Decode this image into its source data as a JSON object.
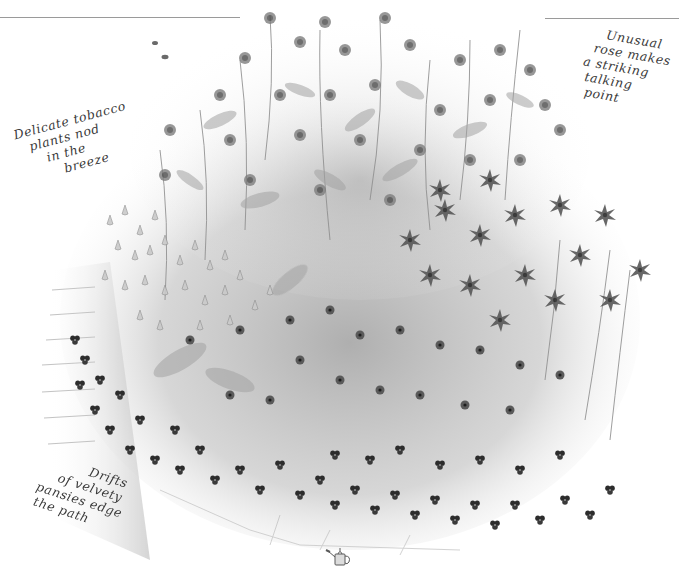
{
  "page": {
    "background": "#ffffff",
    "ink_color": "#3a3a3a",
    "rule_color": "#9a9a9a"
  },
  "illustration": {
    "subject": "cottage-garden-flower-bed",
    "style": "grayscale-watercolor",
    "elements": [
      "tall-flowering-shrubs",
      "nicotiana-tobacco-plants",
      "unusual-rose",
      "velvety-pansies",
      "brick-path",
      "bees",
      "watering-can-ornament"
    ]
  },
  "captions": {
    "rose": {
      "lines": [
        "Unusual",
        "rose makes",
        "a striking",
        "talking",
        "point"
      ]
    },
    "tobacco": {
      "lines": [
        "Delicate tobacco",
        "plants nod",
        "in the",
        "breeze"
      ]
    },
    "pansies": {
      "lines": [
        "Drifts",
        "of velvety",
        "pansies edge",
        "the path"
      ]
    }
  },
  "icons": {
    "watering_can": "watering-can-icon",
    "bee": "bee-icon"
  }
}
